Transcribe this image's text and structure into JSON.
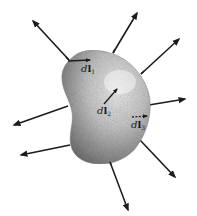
{
  "diagram": {
    "colors": {
      "background": "#ffffff",
      "arrow": "#1c1c1c",
      "body_light": "#e6e6e6",
      "body_dark": "#7a7a7a"
    },
    "labels": [
      {
        "id": "dl1",
        "d": "d",
        "l": "l",
        "sub": "1"
      },
      {
        "id": "dl2",
        "d": "d",
        "l": "l",
        "sub": "2"
      },
      {
        "id": "dl3",
        "d": "d",
        "l": "l",
        "sub": "3"
      }
    ],
    "outward_arrows": [
      {
        "from": [
          69,
          60
        ],
        "to": [
          32,
          20
        ]
      },
      {
        "from": [
          113,
          53
        ],
        "to": [
          138,
          12
        ]
      },
      {
        "from": [
          141,
          74
        ],
        "to": [
          180,
          38
        ]
      },
      {
        "from": [
          149,
          105
        ],
        "to": [
          186,
          99
        ]
      },
      {
        "from": [
          68,
          106
        ],
        "to": [
          13,
          125
        ]
      },
      {
        "from": [
          70,
          145
        ],
        "to": [
          20,
          155
        ]
      },
      {
        "from": [
          140,
          140
        ],
        "to": [
          176,
          178
        ]
      },
      {
        "from": [
          110,
          162
        ],
        "to": [
          129,
          211
        ]
      }
    ],
    "line_elements": [
      {
        "label": "dl1",
        "from": [
          68,
          61
        ],
        "to": [
          90,
          60
        ]
      },
      {
        "label": "dl2",
        "from": [
          104,
          104
        ],
        "to": [
          117,
          89
        ]
      },
      {
        "label": "dl3",
        "from": [
          130,
          117
        ],
        "to": [
          148,
          116
        ]
      }
    ]
  }
}
